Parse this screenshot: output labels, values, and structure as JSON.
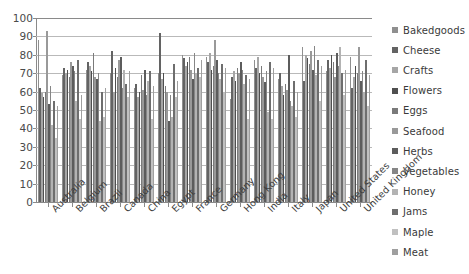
{
  "chart_data": {
    "type": "bar",
    "title": "",
    "subtitle": "",
    "xlabel": "",
    "ylabel": "",
    "ylim": [
      0,
      100
    ],
    "yticks": [
      0,
      10,
      20,
      30,
      40,
      50,
      60,
      70,
      80,
      90,
      100
    ],
    "ytick_labels": [
      "0",
      "10",
      "20",
      "30",
      "40",
      "50",
      "60",
      "70",
      "80",
      "90",
      "100"
    ],
    "grid": true,
    "legend_position": "right",
    "categories": [
      "Australia",
      "Belgium",
      "Brazil",
      "Canada",
      "China",
      "Egypt",
      "France",
      "Germany",
      "Hong Kong",
      "India",
      "Italy",
      "Japan",
      "United States",
      "United Kingdom"
    ],
    "series": [
      {
        "name": "Bakedgoods",
        "color": "#8f8f8f",
        "values": [
          88,
          69,
          72,
          70,
          62,
          70,
          80,
          79,
          56,
          77,
          67,
          84,
          71,
          79
        ]
      },
      {
        "name": "Cheese",
        "color": "#636363",
        "values": [
          62,
          73,
          76,
          82,
          64,
          92,
          78,
          76,
          68,
          73,
          70,
          66,
          77,
          62
        ]
      },
      {
        "name": "Crafts",
        "color": "#a6a6a6",
        "values": [
          59,
          70,
          74,
          60,
          57,
          67,
          74,
          81,
          71,
          79,
          63,
          80,
          73,
          68
        ]
      },
      {
        "name": "Flowers",
        "color": "#4f4f4f",
        "values": [
          57,
          72,
          71,
          73,
          60,
          70,
          76,
          72,
          66,
          70,
          58,
          78,
          80,
          74
        ]
      },
      {
        "name": "Eggs",
        "color": "#7a7a7a",
        "values": [
          60,
          68,
          81,
          68,
          69,
          63,
          79,
          74,
          73,
          74,
          64,
          75,
          76,
          70
        ]
      },
      {
        "name": "Seafood",
        "color": "#999999",
        "values": [
          93,
          76,
          68,
          77,
          61,
          60,
          72,
          88,
          70,
          68,
          61,
          82,
          68,
          84
        ]
      },
      {
        "name": "Herbs",
        "color": "#5c5c5c",
        "values": [
          53,
          74,
          67,
          79,
          72,
          44,
          67,
          77,
          76,
          65,
          80,
          72,
          81,
          66
        ]
      },
      {
        "name": "Vegetables",
        "color": "#868686",
        "values": [
          63,
          71,
          70,
          62,
          58,
          58,
          81,
          70,
          72,
          71,
          55,
          85,
          74,
          71
        ]
      },
      {
        "name": "Honey",
        "color": "#b3b3b3",
        "values": [
          42,
          55,
          44,
          72,
          66,
          46,
          70,
          67,
          64,
          49,
          52,
          69,
          84,
          60
        ]
      },
      {
        "name": "Jams",
        "color": "#6e6e6e",
        "values": [
          55,
          77,
          60,
          64,
          71,
          75,
          73,
          75,
          69,
          76,
          66,
          77,
          70,
          77
        ]
      },
      {
        "name": "Maple",
        "color": "#c0c0c0",
        "values": [
          35,
          45,
          46,
          57,
          45,
          57,
          68,
          60,
          45,
          45,
          46,
          55,
          58,
          52
        ]
      },
      {
        "name": "Meat",
        "color": "#9f9f9f",
        "values": [
          52,
          58,
          62,
          71,
          63,
          66,
          77,
          73,
          67,
          73,
          60,
          74,
          72,
          69
        ]
      }
    ]
  },
  "legend": {
    "items": [
      {
        "label": "Bakedgoods"
      },
      {
        "label": "Cheese"
      },
      {
        "label": "Crafts"
      },
      {
        "label": "Flowers"
      },
      {
        "label": "Eggs"
      },
      {
        "label": "Seafood"
      },
      {
        "label": "Herbs"
      },
      {
        "label": "Vegetables"
      },
      {
        "label": "Honey"
      },
      {
        "label": "Jams"
      },
      {
        "label": "Maple"
      },
      {
        "label": "Meat"
      }
    ]
  },
  "style": {
    "background": "#ffffff",
    "axis_color": "#8a8a8a",
    "gridline_color": "#b9b9b9",
    "text_color": "#3a3a3a"
  }
}
